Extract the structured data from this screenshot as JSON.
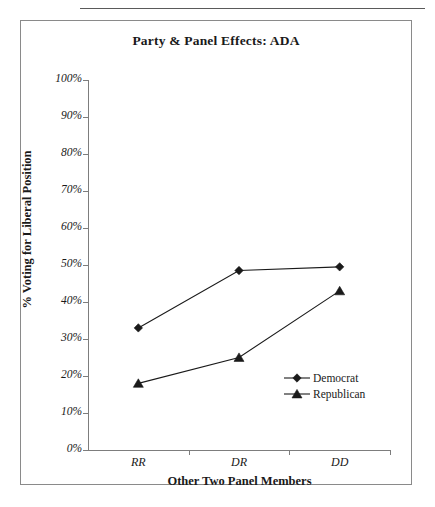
{
  "figure": {
    "title": "Party & Panel Effects: ADA"
  },
  "chart_data": {
    "type": "line",
    "title": "Party & Panel Effects: ADA",
    "xlabel": "Other Two Panel Members",
    "ylabel": "% Voting for Liberal Position",
    "categories": [
      "RR",
      "DR",
      "DD"
    ],
    "ylim": [
      0,
      100
    ],
    "ytick_labels": [
      "0%",
      "10%",
      "20%",
      "30%",
      "40%",
      "50%",
      "60%",
      "70%",
      "80%",
      "90%",
      "100%"
    ],
    "ytick_values": [
      0,
      10,
      20,
      30,
      40,
      50,
      60,
      70,
      80,
      90,
      100
    ],
    "grid": false,
    "legend_position": "inside-right",
    "series": [
      {
        "name": "Democrat",
        "marker": "diamond",
        "color": "#1a1a1a",
        "values": [
          33,
          48.5,
          49.5
        ]
      },
      {
        "name": "Republican",
        "marker": "triangle",
        "color": "#1a1a1a",
        "values": [
          18,
          25,
          43
        ]
      }
    ]
  }
}
